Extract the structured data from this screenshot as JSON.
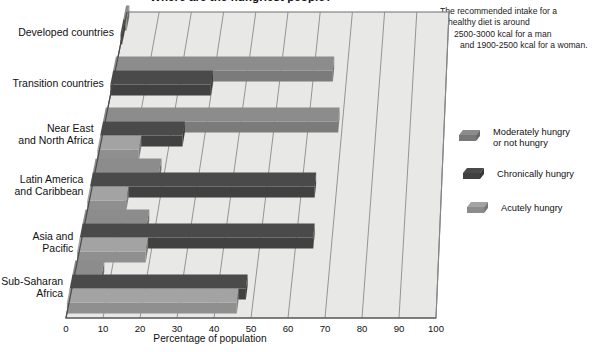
{
  "chart_data": {
    "type": "bar",
    "orientation": "horizontal",
    "title": "Where are the hungriest people?",
    "xlabel": "Percentage of population",
    "ylabel": "",
    "xlim": [
      0,
      100
    ],
    "xticks": [
      "0",
      "10",
      "20",
      "30",
      "40",
      "50",
      "60",
      "70",
      "80",
      "90",
      "100"
    ],
    "grid": true,
    "legend_position": "right",
    "categories": [
      "Developed countries",
      "Transition countries",
      "Near East and North Africa",
      "Latin America and Caribbean",
      "Asia and Pacific",
      "Sub-Saharan Africa"
    ],
    "series": [
      {
        "name": "Moderately hungry or not hungry",
        "color": "#8c8c8c",
        "values": [
          1,
          66,
          69,
          19,
          18,
          8
        ]
      },
      {
        "name": "Chronically hungry",
        "color": "#4a4a4a",
        "values": [
          0.5,
          30,
          24,
          64,
          65,
          48
        ]
      },
      {
        "name": "Acutely hungry",
        "color": "#a3a3a3",
        "values": [
          0,
          0,
          12,
          11,
          19,
          46
        ]
      }
    ],
    "annotation": "The recommended intake for a healthy diet is around 2500-3000 kcal for a man and 1900-2500 kcal for a woman."
  },
  "chart": {
    "title": "Where are the hungriest people?",
    "xlabel": "Percentage of population"
  },
  "note": {
    "line1": "The recommended intake for a",
    "line2": "healthy diet is around",
    "line3": "2500-3000 kcal for a man",
    "line4": "and 1900-2500 kcal for a woman."
  },
  "categories": [
    {
      "line1": "Developed countries",
      "line2": ""
    },
    {
      "line1": "Transition countries",
      "line2": ""
    },
    {
      "line1": "Near East",
      "line2": "and North Africa"
    },
    {
      "line1": "Latin America",
      "line2": "and Caribbean"
    },
    {
      "line1": "Asia and Pacific",
      "line2": ""
    },
    {
      "line1": "Sub-Saharan",
      "line2": "Africa"
    }
  ],
  "xticks": [
    "0",
    "10",
    "20",
    "30",
    "40",
    "50",
    "60",
    "70",
    "80",
    "90",
    "100"
  ],
  "legend": [
    {
      "line1": "Moderately hungry",
      "line2": "or not hungry",
      "color": "#8c8c8c"
    },
    {
      "line1": "Chronically hungry",
      "line2": "",
      "color": "#4a4a4a"
    },
    {
      "line1": "Acutely hungry",
      "line2": "",
      "color": "#a3a3a3"
    }
  ],
  "colors": {
    "panel": "#e8e8e6",
    "panel_edge": "#6f6f6f",
    "gridline": "#8a8a8a",
    "series_moderate": "#8c8c8c",
    "series_chronic": "#4a4a4a",
    "series_acute": "#a3a3a3"
  }
}
